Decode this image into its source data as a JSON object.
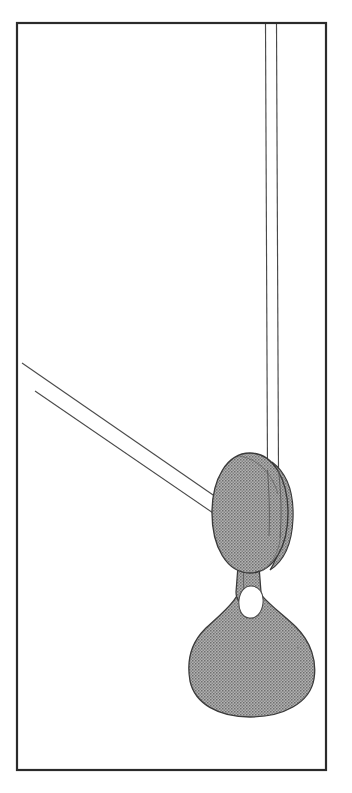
{
  "figure": {
    "caption": "",
    "label": "",
    "background_color": "#ffffff",
    "canvas": {
      "width": 352,
      "height": 793
    }
  },
  "frame": {
    "name": "figure-border",
    "shape": "rectangle",
    "x": 16,
    "y": 22,
    "width": 311,
    "height": 749,
    "stroke_color": "#2b2b2b",
    "stroke_width": 2.2,
    "fill": "none"
  },
  "fills": {
    "halftone_gray": "#9a9a9a",
    "halftone_dot": "#6f6f6f",
    "outline_dark": "#3a3a3a",
    "outline_mid": "#555555",
    "highlight_white": "#ffffff"
  },
  "parts": [
    {
      "id": "vertical-tube",
      "name": "vertical-tube",
      "description": "Narrow vertical twin-line tube descending from the top border into the bulb",
      "line_left_x": 265,
      "line_right_x": 276,
      "top_y": 23,
      "bottom_y": 560,
      "stroke_color": "#4a4a4a",
      "stroke_width": 1.1
    },
    {
      "id": "diagonal-tube",
      "name": "diagonal-tube",
      "description": "Narrow diagonal twin-line tube entering the bulb from the upper left",
      "upper_start": [
        22,
        363
      ],
      "upper_end": [
        216,
        497
      ],
      "lower_start": [
        35,
        391
      ],
      "lower_end": [
        216,
        515
      ],
      "stroke_color": "#4a4a4a",
      "stroke_width": 1.1
    },
    {
      "id": "upper-bulb",
      "name": "upper-bulb-ellipse",
      "description": "Large shaded ovoid bulb",
      "center": [
        249,
        513
      ],
      "radius_x": 38,
      "radius_y": 60,
      "fill": "#9a9a9a",
      "stroke_color": "#3a3a3a"
    },
    {
      "id": "bulb-right-lobe",
      "name": "bulb-right-lobe",
      "description": "Narrow crescent lobe on the right flank of the upper bulb",
      "fill": "#9a9a9a",
      "stroke_color": "#3a3a3a"
    },
    {
      "id": "neck",
      "name": "connecting-neck",
      "description": "Short narrow neck joining the upper bulb to the lower teardrop",
      "x": 237,
      "y": 568,
      "width": 22,
      "height": 32,
      "fill": "#9a9a9a",
      "stroke_color": "#3a3a3a"
    },
    {
      "id": "lower-teardrop",
      "name": "lower-teardrop-body",
      "description": "Large pear / teardrop shaped shaded body below the neck",
      "apex": [
        248,
        572
      ],
      "center": [
        250,
        660
      ],
      "radius_x": 63,
      "radius_y": 57,
      "fill": "#9a9a9a",
      "stroke_color": "#3a3a3a"
    },
    {
      "id": "neck-highlight",
      "name": "neck-highlight-oval",
      "description": "Small white oval highlight inside the neck region",
      "center": [
        251,
        601
      ],
      "radius_x": 10,
      "radius_y": 16,
      "fill": "#ffffff",
      "stroke_color": "#4a4a4a"
    },
    {
      "id": "bulb-top-arc",
      "name": "bulb-top-contour-arc",
      "description": "Faint contour arc across the upper right of the bulb",
      "stroke_color": "#6a6a6a"
    }
  ],
  "annotations": [],
  "legend": {
    "visible": false,
    "items": []
  }
}
